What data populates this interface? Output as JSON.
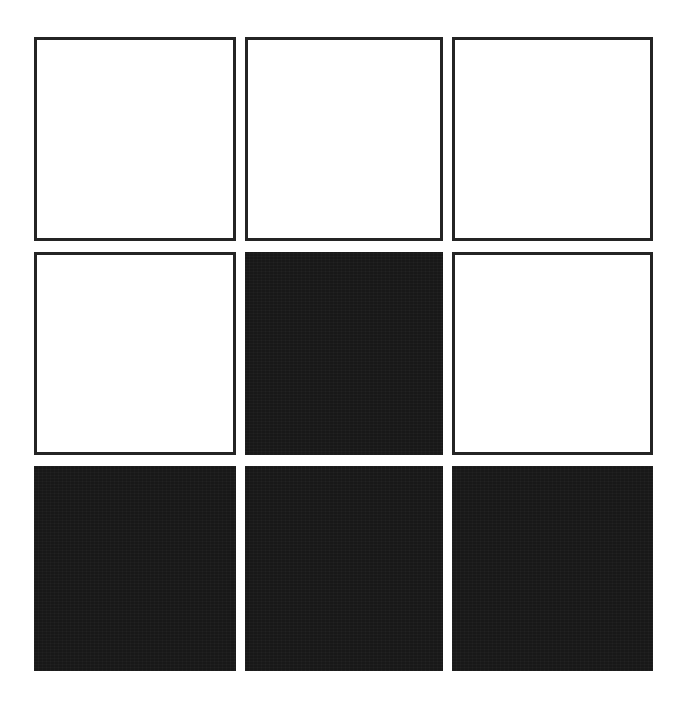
{
  "page": {
    "background_color": "#ffffff",
    "width": 697,
    "height": 706
  },
  "grid": {
    "rows": 3,
    "columns": 3,
    "outline_color": "#242424",
    "fill_color": "#181818",
    "empty_color": "#ffffff",
    "border_width_px": 3,
    "column_gap_px": 9,
    "row_gap_px": 11,
    "origin_x_px": 34,
    "origin_y_px": 37,
    "cells": [
      {
        "id": "r1c1",
        "row": 1,
        "col": 1,
        "state": "outline",
        "label": ""
      },
      {
        "id": "r1c2",
        "row": 1,
        "col": 2,
        "state": "outline",
        "label": ""
      },
      {
        "id": "r1c3",
        "row": 1,
        "col": 3,
        "state": "outline",
        "label": ""
      },
      {
        "id": "r2c1",
        "row": 2,
        "col": 1,
        "state": "outline",
        "label": ""
      },
      {
        "id": "r2c2",
        "row": 2,
        "col": 2,
        "state": "filled",
        "label": ""
      },
      {
        "id": "r2c3",
        "row": 2,
        "col": 3,
        "state": "outline",
        "label": ""
      },
      {
        "id": "r3c1",
        "row": 3,
        "col": 1,
        "state": "filled",
        "label": ""
      },
      {
        "id": "r3c2",
        "row": 3,
        "col": 2,
        "state": "filled",
        "label": ""
      },
      {
        "id": "r3c3",
        "row": 3,
        "col": 3,
        "state": "filled",
        "label": ""
      }
    ]
  }
}
